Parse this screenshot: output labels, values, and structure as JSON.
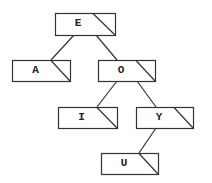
{
  "diagram": {
    "type": "binary-tree",
    "line_color": "#333333",
    "background": "#ffffff",
    "nodes": [
      {
        "id": "E",
        "label": "E",
        "x": 55,
        "y": 13,
        "w": 60,
        "h": 22,
        "diag_x": 93
      },
      {
        "id": "A",
        "label": "A",
        "x": 12,
        "y": 60,
        "w": 58,
        "h": 21,
        "diag_x": 51
      },
      {
        "id": "O",
        "label": "O",
        "x": 98,
        "y": 60,
        "w": 57,
        "h": 21,
        "diag_x": 136
      },
      {
        "id": "I",
        "label": "I",
        "x": 58,
        "y": 107,
        "w": 59,
        "h": 21,
        "diag_x": 97
      },
      {
        "id": "Y",
        "label": "Y",
        "x": 136,
        "y": 107,
        "w": 57,
        "h": 21,
        "diag_x": 174
      },
      {
        "id": "U",
        "label": "U",
        "x": 101,
        "y": 153,
        "w": 57,
        "h": 21,
        "diag_x": 139
      }
    ],
    "edges": [
      {
        "from": "E",
        "to": "A",
        "x1": 74,
        "y1": 35,
        "x2": 51,
        "y2": 60
      },
      {
        "from": "E",
        "to": "O",
        "x1": 96,
        "y1": 35,
        "x2": 117,
        "y2": 60
      },
      {
        "from": "O",
        "to": "I",
        "x1": 117,
        "y1": 81,
        "x2": 97,
        "y2": 107
      },
      {
        "from": "O",
        "to": "Y",
        "x1": 137,
        "y1": 81,
        "x2": 156,
        "y2": 107
      },
      {
        "from": "Y",
        "to": "U",
        "x1": 156,
        "y1": 128,
        "x2": 139,
        "y2": 153
      }
    ]
  }
}
